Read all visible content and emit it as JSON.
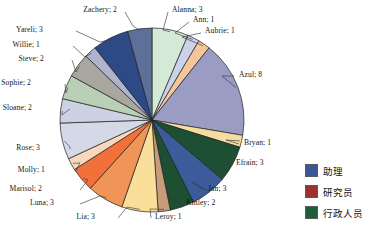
{
  "chart_data": {
    "type": "pie",
    "title": "",
    "start_angle_deg": 0,
    "direction": "clockwise",
    "total": 47,
    "label_format": "name; value",
    "categories": [
      "Alanna",
      "Ann",
      "Aubrie",
      "Azul",
      "Bryan",
      "Efrain",
      "Jan",
      "Kinley",
      "Leroy",
      "Lia",
      "Luna",
      "Marisol",
      "Molly",
      "Rose",
      "Sloane",
      "Sophie",
      "Steve",
      "Willie",
      "Yareli",
      "Zachery"
    ],
    "values": [
      3,
      1,
      1,
      8,
      1,
      3,
      3,
      2,
      1,
      3,
      3,
      2,
      1,
      3,
      2,
      2,
      2,
      1,
      3,
      2
    ],
    "slices": [
      {
        "label": "Alanna; 3",
        "name": "Alanna",
        "value": 3,
        "color": "#d4ead6",
        "side": "top"
      },
      {
        "label": "Ann; 1",
        "name": "Ann",
        "value": 1,
        "color": "#ccd2e8",
        "side": "top"
      },
      {
        "label": "Aubrie; 1",
        "name": "Aubrie",
        "value": 1,
        "color": "#f3c79a",
        "side": "top"
      },
      {
        "label": "Azul; 8",
        "name": "Azul",
        "value": 8,
        "color": "#9a9cc4",
        "side": "right"
      },
      {
        "label": "Bryan; 1",
        "name": "Bryan",
        "value": 1,
        "color": "#f5dca0",
        "side": "right"
      },
      {
        "label": "Efrain; 3",
        "name": "Efrain",
        "value": 3,
        "color": "#1d4f33",
        "side": "right"
      },
      {
        "label": "Jan; 3",
        "name": "Jan",
        "value": 3,
        "color": "#3c5b9b",
        "side": "right"
      },
      {
        "label": "Kinley; 2",
        "name": "Kinley",
        "value": 2,
        "color": "#1d4f33",
        "side": "bottom"
      },
      {
        "label": "Leroy; 1",
        "name": "Leroy",
        "value": 1,
        "color": "#c89b7a",
        "side": "bottom"
      },
      {
        "label": "Lia; 3",
        "name": "Lia",
        "value": 3,
        "color": "#fadf9b",
        "side": "bottom"
      },
      {
        "label": "Luna; 3",
        "name": "Luna",
        "value": 3,
        "color": "#f09558",
        "side": "left"
      },
      {
        "label": "Marisol; 2",
        "name": "Marisol",
        "value": 2,
        "color": "#f2713a",
        "side": "left"
      },
      {
        "label": "Molly; 1",
        "name": "Molly",
        "value": 1,
        "color": "#fad6bc",
        "side": "left"
      },
      {
        "label": "Rose; 3",
        "name": "Rose",
        "value": 3,
        "color": "#d5d8e6",
        "side": "left"
      },
      {
        "label": "Sloane; 2",
        "name": "Sloane",
        "value": 2,
        "color": "#ccd2e3",
        "side": "left"
      },
      {
        "label": "Sophie; 2",
        "name": "Sophie",
        "value": 2,
        "color": "#b9cfb6",
        "side": "left"
      },
      {
        "label": "Steve; 2",
        "name": "Steve",
        "value": 2,
        "color": "#a8a8a0",
        "side": "left"
      },
      {
        "label": "Willie; 1",
        "name": "Willie",
        "value": 1,
        "color": "#b0b3cd",
        "side": "left"
      },
      {
        "label": "Yareli; 3",
        "name": "Yareli",
        "value": 3,
        "color": "#2e4a86",
        "side": "left"
      },
      {
        "label": "Zachery; 2",
        "name": "Zachery",
        "value": 2,
        "color": "#5c7099",
        "side": "top"
      }
    ],
    "legend": {
      "position": "right",
      "entries": [
        {
          "label": "助理",
          "color": "#3b5896"
        },
        {
          "label": "研究员",
          "color": "#993333"
        },
        {
          "label": "行政人员",
          "color": "#1f5c38"
        }
      ]
    },
    "geometry": {
      "cx": 152,
      "cy": 120,
      "r": 92
    }
  }
}
